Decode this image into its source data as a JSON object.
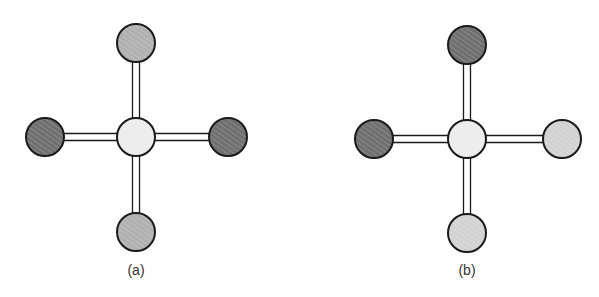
{
  "colors": {
    "dark": "#6f6f6f",
    "medium": "#b4b4b4",
    "light": "#e6e6e6",
    "stroke": "#1a1a1a",
    "bond": "#ffffff"
  },
  "panels": [
    {
      "label": "(a)",
      "center": {
        "x": 136,
        "y": 137,
        "shade": "light"
      },
      "atoms": [
        {
          "pos": "top",
          "x": 136,
          "y": 43,
          "shade": "medium"
        },
        {
          "pos": "left",
          "x": 45,
          "y": 137,
          "shade": "dark"
        },
        {
          "pos": "right",
          "x": 228,
          "y": 137,
          "shade": "dark"
        },
        {
          "pos": "bottom",
          "x": 136,
          "y": 232,
          "shade": "medium"
        }
      ],
      "label_pos": {
        "x": 136,
        "y": 262
      }
    },
    {
      "label": "(b)",
      "center": {
        "x": 467,
        "y": 139,
        "shade": "light"
      },
      "atoms": [
        {
          "pos": "top",
          "x": 467,
          "y": 45,
          "shade": "dark"
        },
        {
          "pos": "left",
          "x": 374,
          "y": 139,
          "shade": "dark"
        },
        {
          "pos": "right",
          "x": 562,
          "y": 139,
          "shade": "light_medium"
        },
        {
          "pos": "bottom",
          "x": 467,
          "y": 233,
          "shade": "light_medium"
        }
      ],
      "label_pos": {
        "x": 467,
        "y": 262
      }
    }
  ],
  "radius": 19
}
